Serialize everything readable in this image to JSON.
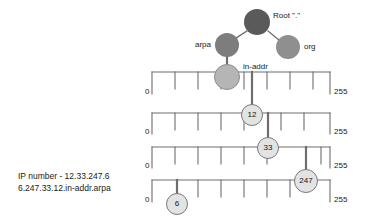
{
  "diagram": {
    "caption_lines": [
      "IP number - 12.33.247.6",
      "6.247.33.12.in-addr.arpa"
    ],
    "tree_nodes": [
      {
        "id": "root",
        "label": "Root \".\"",
        "color": "#5a5a5a",
        "cx": 257,
        "cy": 22,
        "r": 13
      },
      {
        "id": "arpa",
        "label": "arpa",
        "color": "#7d7d7d",
        "cx": 227,
        "cy": 45,
        "r": 12
      },
      {
        "id": "org",
        "label": "org",
        "color": "#8f8f8f",
        "cx": 288,
        "cy": 47,
        "r": 12
      },
      {
        "id": "in-addr",
        "label": "in-addr",
        "color": "#b5b5b5",
        "cx": 227,
        "cy": 77,
        "r": 13
      }
    ],
    "rulers": [
      {
        "id": "octet-1",
        "start_label": "0",
        "end_label": "255",
        "node": {
          "label": "12",
          "value": 12,
          "color": "#e3e3e3"
        }
      },
      {
        "id": "octet-2",
        "start_label": "0",
        "end_label": "255",
        "node": {
          "label": "33",
          "value": 33,
          "color": "#e3e3e3"
        }
      },
      {
        "id": "octet-3",
        "start_label": "0",
        "end_label": "255",
        "node": {
          "label": "247",
          "value": 247,
          "color": "#e3e3e3"
        }
      },
      {
        "id": "octet-4",
        "start_label": "0",
        "end_label": "255",
        "node": {
          "label": "6",
          "value": 6,
          "color": "#e3e3e3"
        }
      }
    ],
    "colors": {
      "line": "#6e6e6e",
      "text": "#1a1a1a",
      "background": "#ffffff",
      "node_stroke": "#7a7a7a"
    }
  }
}
